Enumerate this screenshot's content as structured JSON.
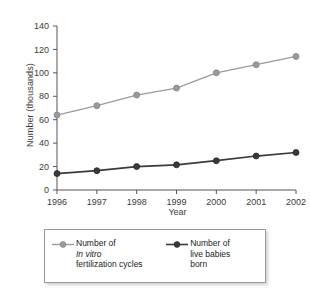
{
  "chart_data": {
    "type": "line",
    "title": "",
    "xlabel": "Year",
    "ylabel": "Number (thousands)",
    "categories": [
      "1996",
      "1997",
      "1998",
      "1999",
      "2000",
      "2001",
      "2002"
    ],
    "x": [
      1996,
      1997,
      1998,
      1999,
      2000,
      2001,
      2002
    ],
    "ylim": [
      0,
      140
    ],
    "yticks": [
      0,
      20,
      40,
      60,
      80,
      100,
      120,
      140
    ],
    "ytick_labels": [
      "0",
      "20",
      "40",
      "60",
      "80",
      "100",
      "120",
      "140"
    ],
    "grid": false,
    "legend_position": "below",
    "series": [
      {
        "name": "Number of In vitro fertilization cycles",
        "color": "#9a9a9a",
        "marker": "circle",
        "values": [
          64,
          72,
          81,
          87,
          100,
          107,
          114
        ]
      },
      {
        "name": "Number of live babies born",
        "color": "#3a3a3a",
        "marker": "circle",
        "values": [
          14,
          16.5,
          20,
          21.5,
          25,
          29,
          32
        ]
      }
    ]
  },
  "axes": {
    "y_title": "Number (thousands)",
    "x_title": "Year"
  },
  "legend": {
    "entries": [
      {
        "line1": "Number of",
        "line2": "In vitro",
        "line2_italic": true,
        "line3": "fertilization cycles",
        "color": "#9a9a9a"
      },
      {
        "line1": "Number of",
        "line2": "live babies",
        "line2_italic": false,
        "line3": "born",
        "color": "#3a3a3a"
      }
    ]
  }
}
